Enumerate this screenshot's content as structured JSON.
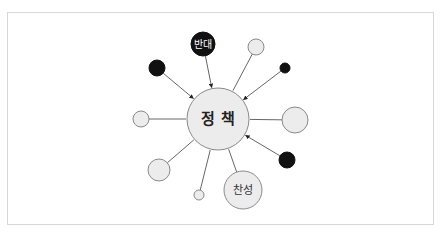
{
  "diagram": {
    "center": {
      "label": "정 책",
      "x": 218,
      "y": 119,
      "r": 31,
      "fill": "#ececec",
      "stroke": "#8a8a8a"
    },
    "nodes": [
      {
        "id": "oppose",
        "label": "반대",
        "x": 203,
        "y": 44,
        "r": 12,
        "fill": "#111111",
        "text_color": "#ffffff",
        "arrow": true
      },
      {
        "id": "black-top-left",
        "label": "",
        "x": 157,
        "y": 68,
        "r": 8,
        "fill": "#111111",
        "arrow": true
      },
      {
        "id": "light-top-right",
        "label": "",
        "x": 256,
        "y": 47,
        "r": 8,
        "fill": "#ececec",
        "arrow": false
      },
      {
        "id": "black-small-right",
        "label": "",
        "x": 285,
        "y": 68,
        "r": 5,
        "fill": "#111111",
        "arrow": true
      },
      {
        "id": "light-right",
        "label": "",
        "x": 295,
        "y": 120,
        "r": 13,
        "fill": "#ececec",
        "arrow": false
      },
      {
        "id": "black-bottom-right",
        "label": "",
        "x": 287,
        "y": 160,
        "r": 8,
        "fill": "#111111",
        "arrow": true
      },
      {
        "id": "support",
        "label": "찬성",
        "x": 243,
        "y": 190,
        "r": 19,
        "fill": "#ececec",
        "text_color": "#333333",
        "arrow": false
      },
      {
        "id": "light-small-bottom",
        "label": "",
        "x": 199,
        "y": 195,
        "r": 5,
        "fill": "#ececec",
        "arrow": false
      },
      {
        "id": "light-bottom-left",
        "label": "",
        "x": 159,
        "y": 170,
        "r": 11,
        "fill": "#ececec",
        "arrow": false
      },
      {
        "id": "light-left",
        "label": "",
        "x": 141,
        "y": 119,
        "r": 8,
        "fill": "#ececec",
        "arrow": false
      }
    ],
    "colors": {
      "line": "#555555",
      "light_stroke": "#8a8a8a",
      "dark_fill": "#111111",
      "light_fill": "#ececec",
      "frame": "#d8d8d8"
    }
  }
}
